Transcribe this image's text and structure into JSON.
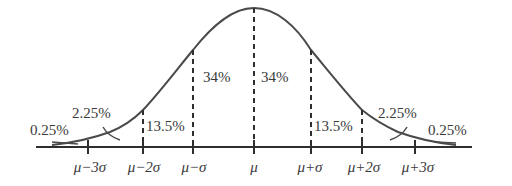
{
  "diagram": {
    "type": "normal-distribution",
    "ink_color": "#3a3a3a",
    "axis_labels": [
      "μ−3σ",
      "μ−2σ",
      "μ−σ",
      "μ",
      "μ+σ",
      "μ+2σ",
      "μ+3σ"
    ],
    "region_labels": {
      "center_left": "34%",
      "center_right": "34%",
      "inner_left": "13.5%",
      "inner_right": "13.5%",
      "outer_left": "2.25%",
      "outer_right": "2.25%",
      "tail_left": "0.25%",
      "tail_right": "0.25%"
    }
  }
}
